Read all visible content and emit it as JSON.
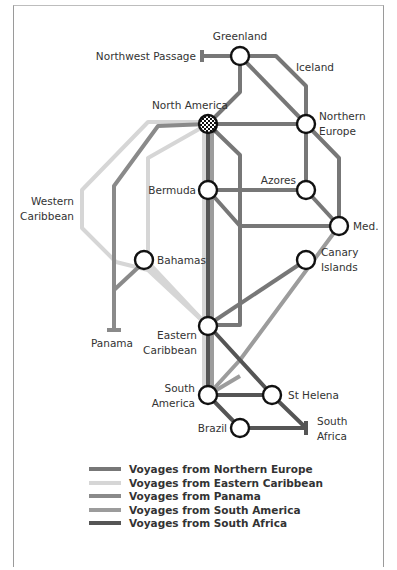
{
  "stations": {
    "greenland": "Greenland",
    "northwest_passage": "Northwest Passage",
    "iceland": "Iceland",
    "north_america": "North America",
    "northern_europe_1": "Northern",
    "northern_europe_2": "Europe",
    "western_caribbean_1": "Western",
    "western_caribbean_2": "Caribbean",
    "bermuda": "Bermuda",
    "azores": "Azores",
    "med": "Med.",
    "canary_1": "Canary",
    "canary_2": "Islands",
    "bahamas": "Bahamas",
    "panama": "Panama",
    "eastern_caribbean_1": "Eastern",
    "eastern_caribbean_2": "Caribbean",
    "south_america_1": "South",
    "south_america_2": "America",
    "st_helena": "St Helena",
    "south_africa_1": "South",
    "south_africa_2": "Africa",
    "brazil": "Brazil"
  },
  "legend": [
    {
      "label": "Voyages from Northern Europe",
      "color": "#777777"
    },
    {
      "label": "Voyages from Eastern Caribbean",
      "color": "#d6d6d6"
    },
    {
      "label": "Voyages from Panama",
      "color": "#8a8a8a"
    },
    {
      "label": "Voyages from South America",
      "color": "#9c9c9c"
    },
    {
      "label": "Voyages from South Africa",
      "color": "#555555"
    }
  ]
}
